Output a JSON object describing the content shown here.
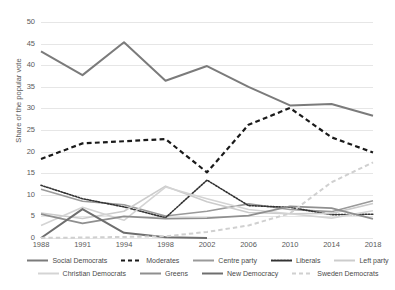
{
  "chart_data": {
    "type": "line",
    "title": "",
    "xlabel": "",
    "ylabel": "Share of the popular vote",
    "categories": [
      "1988",
      "1991",
      "1994",
      "1998",
      "2002",
      "2006",
      "2010",
      "2014",
      "2018"
    ],
    "x": [
      1988,
      1991,
      1994,
      1998,
      2002,
      2006,
      2010,
      2014,
      2018
    ],
    "ylim": [
      0,
      50
    ],
    "yticks": [
      0,
      5,
      10,
      15,
      20,
      25,
      30,
      35,
      40,
      45,
      50
    ],
    "grid": "horizontal",
    "legend_position": "bottom",
    "series": [
      {
        "name": "Social Democrats",
        "color": "#7b7b7b",
        "style": "solid",
        "width": 2.0,
        "values": [
          43.2,
          37.7,
          45.3,
          36.4,
          39.8,
          35.0,
          30.7,
          31.0,
          28.3
        ]
      },
      {
        "name": "Moderates",
        "color": "#1a1a1a",
        "style": "dashed",
        "width": 2.2,
        "values": [
          18.3,
          21.9,
          22.4,
          22.9,
          15.2,
          26.2,
          30.1,
          23.3,
          19.8
        ]
      },
      {
        "name": "Centre party",
        "color": "#9a9a9a",
        "style": "solid",
        "width": 1.6,
        "values": [
          11.3,
          8.5,
          7.7,
          5.1,
          6.2,
          7.9,
          6.6,
          6.1,
          8.6
        ]
      },
      {
        "name": "Liberals",
        "color": "#333333",
        "style": "dotted",
        "width": 1.6,
        "values": [
          12.2,
          9.1,
          7.2,
          4.7,
          13.4,
          7.5,
          7.1,
          5.4,
          5.5
        ]
      },
      {
        "name": "Left party",
        "color": "#cccccc",
        "style": "solid",
        "width": 1.6,
        "values": [
          5.8,
          4.5,
          6.2,
          12.0,
          8.4,
          5.9,
          5.6,
          5.7,
          8.0
        ]
      },
      {
        "name": "Christian Democrats",
        "color": "#d4d4d4",
        "style": "solid",
        "width": 1.6,
        "values": [
          2.9,
          7.1,
          4.1,
          11.8,
          9.1,
          6.6,
          5.6,
          4.6,
          6.3
        ]
      },
      {
        "name": "Greens",
        "color": "#8f8f8f",
        "style": "solid",
        "width": 1.8,
        "values": [
          5.5,
          3.4,
          5.0,
          4.5,
          4.6,
          5.2,
          7.3,
          6.9,
          4.4
        ]
      },
      {
        "name": "New Democracy",
        "color": "#6e6e6e",
        "style": "solid",
        "width": 2.0,
        "values": [
          0.0,
          6.7,
          1.2,
          0.2,
          0.0,
          null,
          null,
          null,
          null
        ]
      },
      {
        "name": "Sweden Democrats",
        "color": "#d0d0d0",
        "style": "dashed",
        "width": 2.0,
        "values": [
          0.02,
          0.1,
          0.25,
          0.4,
          1.4,
          2.9,
          5.7,
          12.9,
          17.5
        ]
      }
    ]
  },
  "legend": {
    "row1": [
      {
        "label": "Social Democrats",
        "color": "#7b7b7b",
        "style": "solid"
      },
      {
        "label": "Moderates",
        "color": "#1a1a1a",
        "style": "dashed"
      },
      {
        "label": "Centre party",
        "color": "#9a9a9a",
        "style": "solid"
      },
      {
        "label": "Liberals",
        "color": "#333333",
        "style": "dotted"
      },
      {
        "label": "Left party",
        "color": "#cccccc",
        "style": "solid"
      }
    ],
    "row2": [
      {
        "label": "Christian Democrats",
        "color": "#d4d4d4",
        "style": "solid"
      },
      {
        "label": "Greens",
        "color": "#8f8f8f",
        "style": "solid"
      },
      {
        "label": "New Democracy",
        "color": "#6e6e6e",
        "style": "solid"
      },
      {
        "label": "Sweden Democrats",
        "color": "#d0d0d0",
        "style": "dashed"
      }
    ]
  }
}
